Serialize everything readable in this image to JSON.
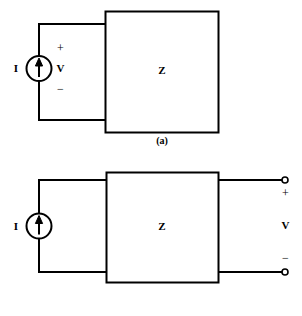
{
  "figure": {
    "background_color": "#ffffff",
    "line_color": "#000000",
    "panels": [
      {
        "id": "a",
        "caption": "(a)",
        "source": {
          "type": "current-source",
          "label": "I",
          "arrow_direction": "up"
        },
        "voltage": {
          "plus": "+",
          "label": "V",
          "minus": "−"
        },
        "box": {
          "label": "Z"
        }
      },
      {
        "id": "b",
        "caption": "(b)",
        "source": {
          "type": "current-source",
          "label": "I",
          "arrow_direction": "up"
        },
        "voltage": {
          "plus": "+",
          "label": "V",
          "minus": "−"
        },
        "box": {
          "label": "Z"
        },
        "terminals": {
          "top": "terminal-node",
          "bottom": "terminal-node"
        }
      }
    ]
  }
}
